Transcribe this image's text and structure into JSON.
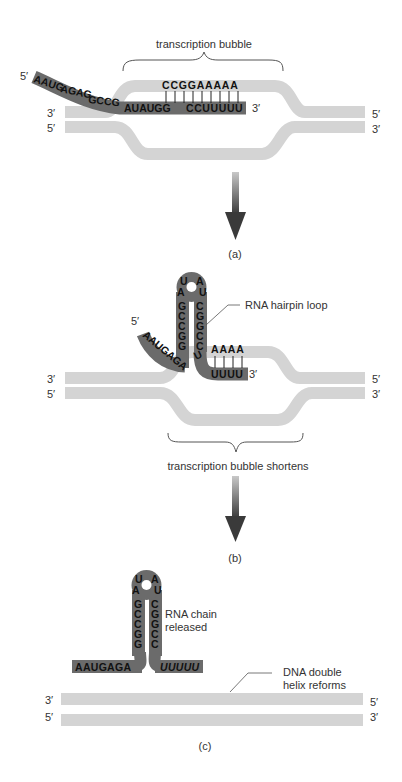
{
  "colors": {
    "dna": "#d4d4d4",
    "rna": "#6b6b6b",
    "arrow_dark": "#3a3a3a",
    "arrow_light": "#bdbdbd",
    "text": "#333333",
    "bases": "#111111"
  },
  "panel_a": {
    "caption": "(a)",
    "bubble_label": "transcription bubble",
    "rna_5prime": "5′",
    "rna_3prime": "3′",
    "rna_sequence": "AAUGAGAGGCCGAUAUGGCCUUUUU",
    "rna_tail_bases": "AAUGAGAGGCCGAUAUGG",
    "rna_paired_bases": [
      "C",
      "C",
      "U",
      "U",
      "U",
      "U",
      "U"
    ],
    "template_paired_bases": [
      "C",
      "C",
      "G",
      "G",
      "A",
      "A",
      "A",
      "A",
      "A"
    ],
    "template_top": "CCGGAAAAA",
    "rna_bottom": "CCUUUUU",
    "dna_left_top": "3′",
    "dna_left_bottom": "5′",
    "dna_right_top": "5′",
    "dna_right_bottom": "3′"
  },
  "panel_b": {
    "caption": "(b)",
    "hairpin_label": "RNA hairpin loop",
    "bubble_label": "transcription bubble shortens",
    "rna_5prime": "5′",
    "rna_3prime": "3′",
    "loop_bases": [
      "U",
      "A",
      "A",
      "U"
    ],
    "stem_left": [
      "G",
      "C",
      "C",
      "G",
      "G"
    ],
    "stem_right": [
      "C",
      "G",
      "G",
      "C",
      "C"
    ],
    "tail_5": "AAUGAGA",
    "stem_bottom_right": "U",
    "template_bases": "AAAA",
    "rna_3_bases": "UUUU",
    "dna_left_top": "3′",
    "dna_left_bottom": "5′",
    "dna_right_top": "5′",
    "dna_right_bottom": "3′"
  },
  "panel_c": {
    "caption": "(c)",
    "released_label_line1": "RNA chain",
    "released_label_line2": "released",
    "helix_label_line1": "DNA double",
    "helix_label_line2": "helix reforms",
    "loop_bases": [
      "U",
      "A",
      "A",
      "U"
    ],
    "stem_left": [
      "G",
      "C",
      "C",
      "G",
      "G"
    ],
    "stem_right": [
      "C",
      "G",
      "G",
      "C",
      "C"
    ],
    "tail_5": "AAUGAGA",
    "tail_3": "UUUUU",
    "dna_left_top": "3′",
    "dna_left_bottom": "5′",
    "dna_right_top": "5′",
    "dna_right_bottom": "3′"
  }
}
